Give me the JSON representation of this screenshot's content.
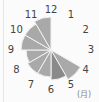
{
  "chart_data": {
    "type": "polar-area",
    "title": "",
    "unit_label": "(月)",
    "categories": [
      "1",
      "2",
      "3",
      "4",
      "5",
      "6",
      "7",
      "8",
      "9",
      "10",
      "11",
      "12"
    ],
    "values": [
      0,
      0,
      0,
      0,
      34,
      30,
      27,
      27,
      25,
      30,
      30,
      33
    ],
    "value_scale_max": 37,
    "colors": {
      "default_fill": "#a9a9a9",
      "highlight_fill": "#8a8a8a",
      "highlight_index": 5,
      "separator": "#f2f2f2",
      "label": "#444444",
      "background": "#fbfbfb"
    },
    "layout": {
      "center": [
        51,
        50
      ],
      "label_radius": 40,
      "start_angle_deg": 0,
      "direction": "clockwise",
      "grid": false,
      "legend": "none"
    }
  }
}
